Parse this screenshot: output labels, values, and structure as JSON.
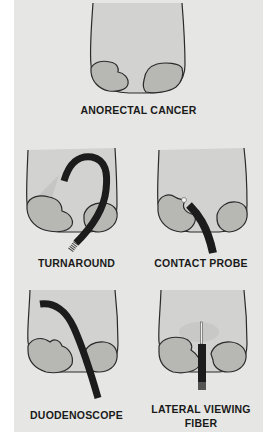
{
  "figure": {
    "panels": [
      {
        "id": "anorectal-cancer",
        "label": "ANORECTAL CANCER"
      },
      {
        "id": "turnaround",
        "label": "TURNAROUND"
      },
      {
        "id": "contact-probe",
        "label": "CONTACT PROBE"
      },
      {
        "id": "duodenoscope",
        "label": "DUODENOSCOPE"
      },
      {
        "id": "lateral-viewing-fiber",
        "label_line1": "LATERAL VIEWING",
        "label_line2": "FIBER"
      }
    ],
    "colors": {
      "background": "#e6e6e4",
      "outline": "#2a2a2a",
      "lumen": "#cfcfcd",
      "tumor": "#b5b5b2",
      "scope": "#1c1c1c"
    }
  }
}
